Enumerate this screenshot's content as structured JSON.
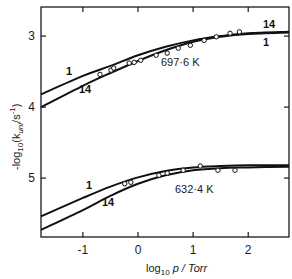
{
  "chart_data": {
    "type": "line",
    "title": "",
    "xlabel": "log10 p / Torr",
    "ylabel": "-log10 (k_uni / s^-1)",
    "xlim": [
      -1.76,
      2.74
    ],
    "ylim": [
      2.59,
      5.83
    ],
    "y_inverted": true,
    "grid": false,
    "legend": "none (curves labelled inline)",
    "x_ticks": [
      -1,
      0,
      1,
      2
    ],
    "x_tick_labels": [
      "-1",
      "0",
      "1",
      "2"
    ],
    "y_ticks": [
      3,
      4,
      5
    ],
    "y_tick_labels": [
      "3",
      "4",
      "5"
    ],
    "annotations": [
      "697·6 K",
      "632·4 K",
      "1",
      "14",
      "1",
      "14",
      "1",
      "14"
    ],
    "series": [
      {
        "name": "697.6 K curve 1",
        "style": "solid line",
        "x": [
          -1.76,
          -1.0,
          -0.5,
          0.0,
          0.5,
          1.0,
          1.5,
          2.0,
          2.74
        ],
        "y": [
          3.82,
          3.56,
          3.42,
          3.27,
          3.15,
          3.06,
          3.0,
          2.96,
          2.94
        ]
      },
      {
        "name": "697.6 K curve 14",
        "style": "solid line",
        "x": [
          -1.76,
          -1.0,
          -0.5,
          0.0,
          0.5,
          1.0,
          1.5,
          2.0,
          2.74
        ],
        "y": [
          4.0,
          3.7,
          3.52,
          3.35,
          3.2,
          3.08,
          3.01,
          2.97,
          2.95
        ]
      },
      {
        "name": "697.6 K experimental",
        "style": "open circles",
        "x": [
          -0.69,
          -0.49,
          -0.44,
          -0.16,
          -0.07,
          0.05,
          0.33,
          0.53,
          0.73,
          0.95,
          1.2,
          1.42,
          1.67,
          1.84
        ],
        "y": [
          3.54,
          3.48,
          3.45,
          3.38,
          3.37,
          3.34,
          3.27,
          3.24,
          3.17,
          3.13,
          3.06,
          3.01,
          2.96,
          2.94
        ]
      },
      {
        "name": "632.4 K curve 1",
        "style": "solid line",
        "x": [
          -1.76,
          -1.0,
          -0.5,
          0.0,
          0.5,
          1.0,
          1.5,
          2.0,
          2.74
        ],
        "y": [
          5.54,
          5.28,
          5.12,
          4.99,
          4.9,
          4.85,
          4.83,
          4.82,
          4.82
        ]
      },
      {
        "name": "632.4 K curve 14",
        "style": "solid line",
        "x": [
          -1.76,
          -1.0,
          -0.5,
          0.0,
          0.5,
          1.0,
          1.5,
          2.0,
          2.74
        ],
        "y": [
          5.73,
          5.45,
          5.25,
          5.08,
          4.96,
          4.89,
          4.86,
          4.85,
          4.84
        ]
      },
      {
        "name": "632.4 K experimental",
        "style": "open circles",
        "x": [
          -0.24,
          -0.13,
          0.38,
          0.53,
          0.82,
          1.13,
          1.45,
          1.76
        ],
        "y": [
          5.08,
          5.06,
          4.96,
          4.93,
          4.89,
          4.83,
          4.89,
          4.89
        ]
      }
    ]
  },
  "labels": {
    "y_axis": "-log",
    "y_axis_sub": "10",
    "y_axis_rest": "(k",
    "y_axis_k_sub": "uni",
    "y_axis_unit": "/s",
    "y_axis_exp": "-1",
    "y_axis_close": ")",
    "x_axis": "log",
    "x_axis_sub": "10",
    "x_axis_rest": " p / Torr",
    "temp_high": "697·6 K",
    "temp_low": "632·4 K",
    "curve_1": "1",
    "curve_14": "14"
  }
}
